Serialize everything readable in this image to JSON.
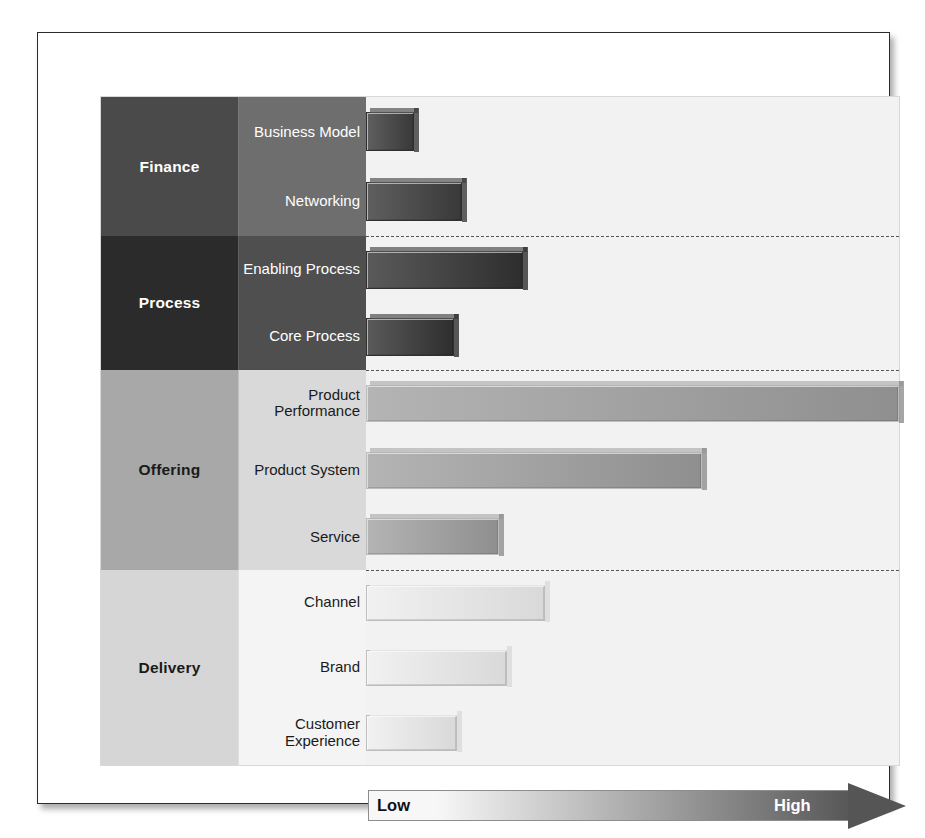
{
  "chart_data": {
    "type": "bar",
    "title": "",
    "subtitle": "",
    "orientation": "horizontal",
    "xlabel": "",
    "ylabel": "",
    "grid": false,
    "legend_position": "bottom",
    "axis_scale_labels": {
      "min": "Low",
      "max": "High"
    },
    "xlim": [
      0,
      100
    ],
    "groups": [
      {
        "name": "Finance",
        "cat_color": "#4a4a4a",
        "sub_color": "#6e6e6e",
        "cat_text_color": "#ffffff",
        "sub_text_color": "#ffffff",
        "bar_color_start": "#5f5f5f",
        "bar_color_end": "#393939",
        "items": [
          {
            "label": "Business Model",
            "value": 9
          },
          {
            "label": "Networking",
            "value": 18
          }
        ]
      },
      {
        "name": "Process",
        "cat_color": "#2b2b2b",
        "sub_color": "#4f4f4f",
        "cat_text_color": "#ffffff",
        "sub_text_color": "#ffffff",
        "bar_color_start": "#5a5a5a",
        "bar_color_end": "#2e2e2e",
        "items": [
          {
            "label": "Enabling Process",
            "value": 29.5
          },
          {
            "label": "Core Process",
            "value": 16.5
          }
        ]
      },
      {
        "name": "Offering",
        "cat_color": "#a8a8a8",
        "sub_color": "#d9d9d9",
        "cat_text_color": "#1a1a1a",
        "sub_text_color": "#1a1a1a",
        "bar_color_start": "#b4b4b4",
        "bar_color_end": "#8f8f8f",
        "items": [
          {
            "label": "Product Performance",
            "value": 100
          },
          {
            "label": "Product System",
            "value": 63
          },
          {
            "label": "Service",
            "value": 25
          }
        ]
      },
      {
        "name": "Delivery",
        "cat_color": "#d6d6d6",
        "sub_color": "#f4f4f4",
        "cat_text_color": "#1a1a1a",
        "sub_text_color": "#1a1a1a",
        "bar_color_start": "#f1f1f1",
        "bar_color_end": "#d9d9d9",
        "items": [
          {
            "label": "Channel",
            "value": 33.5
          },
          {
            "label": "Brand",
            "value": 26.5
          },
          {
            "label": "Customer Experience",
            "value": 17
          }
        ]
      }
    ],
    "categories": [
      "Business Model",
      "Networking",
      "Enabling Process",
      "Core Process",
      "Product Performance",
      "Product System",
      "Service",
      "Channel",
      "Brand",
      "Customer Experience"
    ],
    "values": [
      9,
      18,
      29.5,
      16.5,
      100,
      63,
      25,
      33.5,
      26.5,
      17
    ],
    "group_of_category": [
      "Finance",
      "Finance",
      "Process",
      "Process",
      "Offering",
      "Offering",
      "Offering",
      "Delivery",
      "Delivery",
      "Delivery"
    ]
  },
  "legend": {
    "low_label": "Low",
    "high_label": "High",
    "gradient_start": "#f7f7f7",
    "gradient_end": "#575757"
  },
  "colors": {
    "frame_border": "#2b2b2b",
    "grid_border": "#d8d8d8",
    "plot_background": "#f2f2f2",
    "separator": "#555555"
  }
}
